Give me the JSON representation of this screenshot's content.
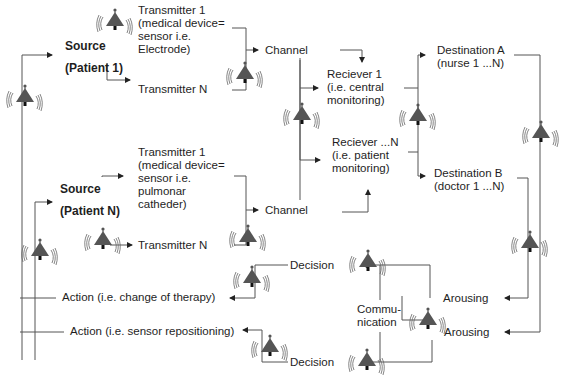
{
  "diagram": {
    "sources": [
      {
        "id": "source-1",
        "label": [
          "Source",
          "(Patient 1)"
        ]
      },
      {
        "id": "source-n",
        "label": [
          "Source",
          "(Patient N)"
        ]
      }
    ],
    "transmitters": {
      "p1_t1": [
        "Transmitter 1",
        "(medical device=",
        "sensor i.e.",
        "Electrode)"
      ],
      "p1_tn": [
        "Transmitter N"
      ],
      "pn_t1": [
        "Transmitter 1",
        "(medical device=",
        "sensor i.e.",
        "pulmonar",
        "catheder)"
      ],
      "pn_tn": [
        "Transmitter N"
      ]
    },
    "channels": {
      "top": "Channel",
      "bottom": "Channel"
    },
    "receivers": {
      "r1": [
        "Reciever 1",
        "(i.e. central",
        "monitoring)"
      ],
      "rn": [
        "Reciever ...N",
        "(i.e. patient",
        "monitoring)"
      ]
    },
    "destinations": {
      "a": [
        "Destination A",
        "(nurse 1 ...N)"
      ],
      "b": [
        "Destination B",
        "(doctor 1 ...N)"
      ]
    },
    "arousing": {
      "top": "Arousing",
      "bottom": "Arousing"
    },
    "communication": [
      "Commu-",
      "nication"
    ],
    "decisions": {
      "top": "Decision",
      "bottom": "Decision"
    },
    "actions": {
      "therapy": "Action (i.e. change of therapy)",
      "sensor": "Action (i.e. sensor repositioning)"
    },
    "icons": {
      "alarm": "alarm-bell-icon"
    },
    "colors": {
      "line": "#555555",
      "bell": "#555555",
      "text": "#1e1e1e",
      "background": "#ffffff"
    }
  }
}
